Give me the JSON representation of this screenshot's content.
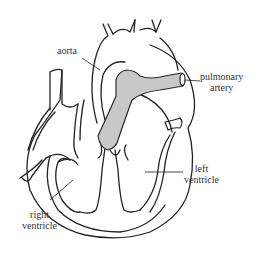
{
  "diagram": {
    "colors": {
      "stroke": "#222222",
      "pulmonary_artery_fill": "#c8c8c8",
      "background": "#ffffff",
      "label_text": "#333333"
    },
    "labels": {
      "aorta": "aorta",
      "pulmonary_artery_line1": "pulmonary",
      "pulmonary_artery_line2": "artery",
      "left_ventricle_line1": "left",
      "left_ventricle_line2": "ventricle",
      "right_ventricle_line1": "right",
      "right_ventricle_line2": "ventricle"
    }
  }
}
